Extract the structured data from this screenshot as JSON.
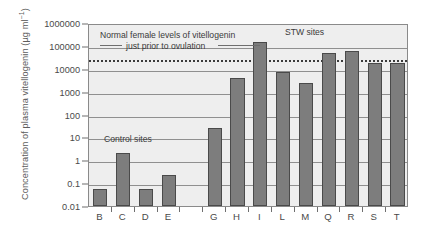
{
  "chart_data": {
    "type": "bar",
    "title": "",
    "xlabel": "",
    "ylabel": "Concentration of plasma vitellogenin (µg ml⁻¹)",
    "yscale": "log",
    "ylim": [
      0.01,
      1000000
    ],
    "grid": true,
    "legend": "none",
    "categories": [
      "B",
      "C",
      "D",
      "E",
      "G",
      "H",
      "I",
      "L",
      "M",
      "Q",
      "R",
      "S",
      "T"
    ],
    "values": [
      0.055,
      2.0,
      0.055,
      0.22,
      25,
      4000,
      150000,
      7000,
      2500,
      50000,
      60000,
      18000,
      18000
    ],
    "ytick_labels": [
      "1000000",
      "100000",
      "10000",
      "1000",
      "100",
      "10",
      "1",
      "0.1",
      "0.01"
    ],
    "ytick_values": [
      1000000,
      100000,
      10000,
      1000,
      100,
      10,
      1,
      0.1,
      0.01
    ],
    "reference_line": {
      "label": "Normal female levels of vitellogenin just prior to ovulation",
      "value": 30000,
      "style": "dotted"
    },
    "annotations": [
      {
        "text": "Normal female levels of vitellogenin",
        "value": 30000
      },
      {
        "text": "just prior to ovulation",
        "value": 30000
      },
      {
        "text": "STW sites",
        "group": [
          "G",
          "H",
          "I",
          "L",
          "M",
          "Q",
          "R",
          "S",
          "T"
        ]
      },
      {
        "text": "Control sites",
        "group": [
          "B",
          "C",
          "D",
          "E"
        ]
      }
    ],
    "bar_color": "#7d7d7d",
    "bar_edge_color": "#4a4a4a",
    "plot_background": "#eeeeee",
    "gridline_color": "#8f8f8f",
    "reference_line_color": "#3b3b3b"
  },
  "axis": {
    "y_title_main": "Concentration of plasma vitellogenin (µg ml",
    "y_title_sup": "−1",
    "y_title_close": ")"
  },
  "labels": {
    "normal_line_1": "Normal female levels of vitellogenin",
    "normal_line_2": "just prior to ovulation",
    "stw_sites": "STW sites",
    "control_sites": "Control sites"
  }
}
